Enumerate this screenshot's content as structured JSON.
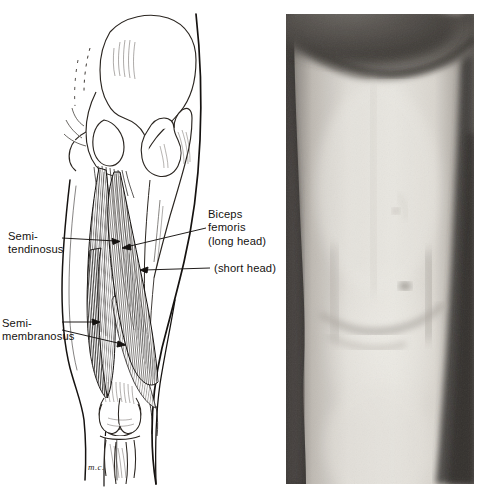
{
  "figure": {
    "type": "anatomical-illustration",
    "region": "posterior thigh / hamstring muscles",
    "background_color": "#ffffff",
    "panels": [
      {
        "id": "drawing",
        "kind": "line-drawing",
        "position": "left"
      },
      {
        "id": "photograph",
        "kind": "grayscale-photograph",
        "position": "right"
      }
    ]
  },
  "drawing": {
    "ink_color": "#151210",
    "signature": "m.c.",
    "labels": [
      {
        "id": "semitendinosus",
        "line1": "Semi-",
        "line2": "tendinosus",
        "side": "left",
        "text_x": 8,
        "text_y": 230,
        "leader": {
          "from_x": 62,
          "from_y": 238,
          "to_x": 118,
          "to_y": 241
        }
      },
      {
        "id": "semimembranosus",
        "line1": "Semi-",
        "line2": "membranosus",
        "side": "left",
        "text_x": 2,
        "text_y": 317,
        "leader": {
          "from_x": 62,
          "from_y": 324,
          "to_x": 96,
          "to_y": 324
        }
      },
      {
        "id": "biceps-femoris-long-head",
        "line1": "Biceps",
        "line2": "femoris",
        "line3": "(long head)",
        "side": "right",
        "text_x": 208,
        "text_y": 208,
        "leader": {
          "from_x": 205,
          "from_y": 228,
          "to_x": 125,
          "to_y": 247
        }
      },
      {
        "id": "biceps-femoris-short-head",
        "line1": "(short head)",
        "side": "right",
        "text_x": 214,
        "text_y": 262,
        "leader": {
          "from_x": 210,
          "from_y": 267,
          "to_x": 142,
          "to_y": 270
        }
      }
    ]
  },
  "photograph": {
    "description": "grayscale photograph of a posterior thigh and knee",
    "frame": {
      "x": 286,
      "y": 14,
      "width": 188,
      "height": 470
    },
    "colors": {
      "skin_light": "#e6e3dd",
      "skin_mid": "#cfcbc4",
      "shadow": "#6f6a65",
      "dark_background": "#3a3734",
      "crease_dark": "#2e2b28"
    }
  }
}
